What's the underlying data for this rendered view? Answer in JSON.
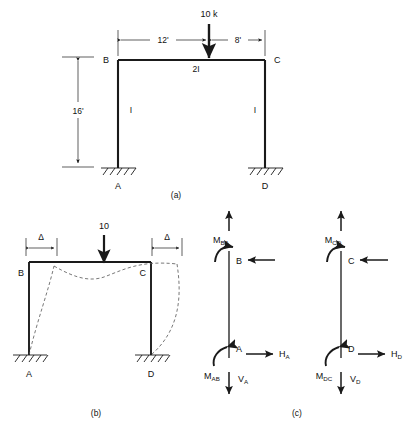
{
  "figure": {
    "line_color": "#1a1a1a",
    "dash_color": "#555555",
    "background": "#ffffff"
  },
  "panels": [
    {
      "id": "a",
      "caption": "(a)",
      "description": "Rigid frame ABCD with fixed supports at A and D, loaded by a 10 k point load on the beam",
      "nodes": [
        {
          "name": "B",
          "label": "B",
          "position": "top-left"
        },
        {
          "name": "C",
          "label": "C",
          "position": "top-right"
        },
        {
          "name": "A",
          "label": "A",
          "position": "bottom-left"
        },
        {
          "name": "D",
          "label": "D",
          "position": "bottom-right"
        }
      ],
      "members": [
        {
          "name": "beam-bc",
          "label": "2I",
          "moment_of_inertia": "2I"
        },
        {
          "name": "column-ab",
          "label": "I",
          "moment_of_inertia": "I"
        },
        {
          "name": "column-cd",
          "label": "I",
          "moment_of_inertia": "I"
        }
      ],
      "load": {
        "label": "10 k",
        "magnitude": 10,
        "unit": "k",
        "direction": "down"
      },
      "dimensions": [
        {
          "name": "span-left",
          "label": "12'",
          "value": 12,
          "unit": "ft",
          "orientation": "horizontal"
        },
        {
          "name": "span-right",
          "label": "8'",
          "value": 8,
          "unit": "ft",
          "orientation": "horizontal"
        },
        {
          "name": "column-height",
          "label": "16'",
          "value": 16,
          "unit": "ft",
          "orientation": "vertical"
        }
      ],
      "supports": [
        {
          "name": "support-a",
          "type": "fixed",
          "label": "A"
        },
        {
          "name": "support-d",
          "type": "fixed",
          "label": "D"
        }
      ]
    },
    {
      "id": "b",
      "caption": "(b)",
      "description": "Deflected shape of the frame showing sidesway displacement delta at both column tops",
      "nodes": [
        {
          "name": "B",
          "label": "B"
        },
        {
          "name": "C",
          "label": "C"
        },
        {
          "name": "A",
          "label": "A"
        },
        {
          "name": "D",
          "label": "D"
        }
      ],
      "load": {
        "label": "10",
        "magnitude": 10,
        "unit": "",
        "direction": "down"
      },
      "dimensions": [
        {
          "name": "sidesway-left",
          "label": "Δ",
          "symbol": "delta",
          "orientation": "horizontal"
        },
        {
          "name": "sidesway-right",
          "label": "Δ",
          "symbol": "delta",
          "orientation": "horizontal"
        }
      ],
      "supports": [
        {
          "name": "support-a",
          "type": "fixed",
          "label": "A"
        },
        {
          "name": "support-d",
          "type": "fixed",
          "label": "D"
        }
      ]
    },
    {
      "id": "c",
      "caption": "(c)",
      "description": "Free-body diagrams of the two columns showing end moments, shears, and reactions",
      "free_bodies": [
        {
          "name": "fbd-column-ab",
          "top_node": "B",
          "bottom_node": "A",
          "moment_top": "M",
          "moment_top_sub": "BA",
          "moment_bottom": "M",
          "moment_bottom_sub": "AB",
          "horizontal_reaction": "H",
          "horizontal_reaction_sub": "A",
          "vertical_reaction": "V",
          "vertical_reaction_sub": "A",
          "top_axial_direction": "up",
          "top_shear_direction": "left",
          "base_horizontal_direction": "right",
          "base_vertical_direction": "down"
        },
        {
          "name": "fbd-column-cd",
          "top_node": "C",
          "bottom_node": "D",
          "moment_top": "M",
          "moment_top_sub": "CD",
          "moment_bottom": "M",
          "moment_bottom_sub": "DC",
          "horizontal_reaction": "H",
          "horizontal_reaction_sub": "D",
          "vertical_reaction": "V",
          "vertical_reaction_sub": "D",
          "top_axial_direction": "up",
          "top_shear_direction": "left",
          "base_horizontal_direction": "right",
          "base_vertical_direction": "down"
        }
      ]
    }
  ]
}
